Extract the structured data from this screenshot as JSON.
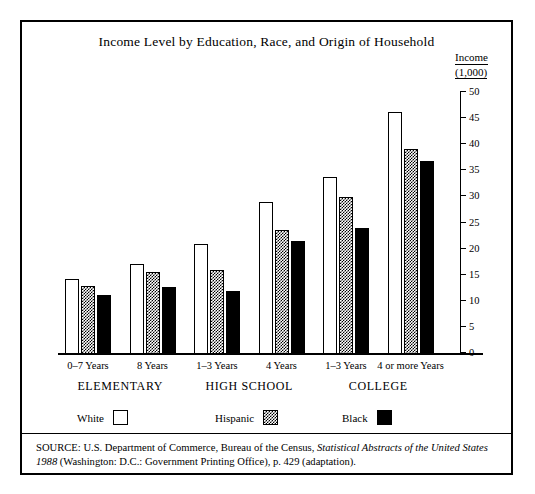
{
  "chart_data": {
    "type": "bar",
    "title": "Income Level by Education, Race, and Origin of Household",
    "xlabel": "",
    "ylabel": "Income (1,000)",
    "ylim": [
      0,
      50
    ],
    "yticks": [
      0,
      5,
      10,
      15,
      20,
      25,
      30,
      35,
      40,
      45,
      50
    ],
    "grid": false,
    "legend_position": "below-axis",
    "categories": [
      "0–7 Years",
      "8 Years",
      "1–3 Years",
      "4 Years",
      "1–3 Years",
      "4 or more Years"
    ],
    "category_groups": [
      {
        "label": "ELEMENTARY",
        "categories": [
          "0–7 Years",
          "8 Years"
        ]
      },
      {
        "label": "HIGH SCHOOL",
        "categories": [
          "1–3 Years",
          "4 Years"
        ]
      },
      {
        "label": "COLLEGE",
        "categories": [
          "1–3 Years",
          "4 or more Years"
        ]
      }
    ],
    "series": [
      {
        "name": "White",
        "fill": "open",
        "values": [
          14.3,
          17.3,
          21.0,
          29.2,
          33.9,
          46.3
        ]
      },
      {
        "name": "Hispanic",
        "fill": "checkered",
        "values": [
          13.0,
          15.8,
          16.0,
          23.8,
          30.0,
          39.2
        ]
      },
      {
        "name": "Black",
        "fill": "solid-black",
        "values": [
          11.3,
          12.9,
          12.1,
          21.7,
          24.2,
          36.9
        ]
      }
    ]
  },
  "axis_caption": {
    "line1": "Income",
    "line2": "(1,000)"
  },
  "legend": {
    "items": [
      {
        "label": "White",
        "swatch": "open-square-swatch"
      },
      {
        "label": "Hispanic",
        "swatch": "checkered-square-swatch"
      },
      {
        "label": "Black",
        "swatch": "solid-black-square-swatch"
      }
    ]
  },
  "source": {
    "prefix": "SOURCE:  U.S. Department of Commerce, Bureau of the Census, ",
    "italic1": "Statistical Abstracts of the United States",
    "middle": " ",
    "italic2": "1988",
    "suffix": " (Washington: D.C.: Government Printing Office), p. 429 (adaptation)."
  },
  "colors": {
    "ink": "#000000",
    "paper": "#ffffff"
  }
}
